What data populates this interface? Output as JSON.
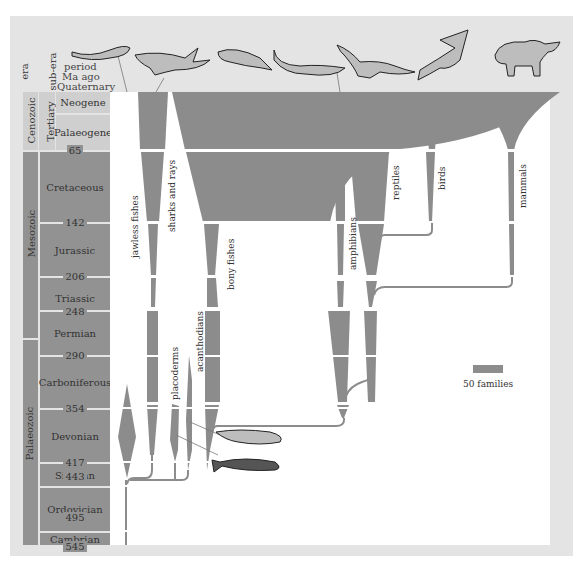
{
  "header": {
    "era": "era",
    "sub_era": "sub-era",
    "period": "period",
    "ma_ago": "Ma ago"
  },
  "eras": [
    {
      "name": "Cenozoic",
      "from": 0,
      "to": 65,
      "subera": "Tertiary"
    },
    {
      "name": "Mesozoic",
      "from": 65,
      "to": 248
    },
    {
      "name": "Palaeozoic",
      "from": 248,
      "to": 545
    }
  ],
  "periods": [
    {
      "name": "Quaternary"
    },
    {
      "name": "Neogene"
    },
    {
      "name": "Palaeogene"
    },
    {
      "name": "Cretaceous"
    },
    {
      "name": "Jurassic"
    },
    {
      "name": "Triassic"
    },
    {
      "name": "Permian"
    },
    {
      "name": "Carboniferous"
    },
    {
      "name": "Devonian"
    },
    {
      "name": "Silurian"
    },
    {
      "name": "Ordovician"
    },
    {
      "name": "Cambrian"
    }
  ],
  "boundaries": [
    "65",
    "142",
    "206",
    "248",
    "290",
    "354",
    "417",
    "443",
    "495",
    "545"
  ],
  "groups": [
    {
      "label": "jawless fishes"
    },
    {
      "label": "sharks and rays"
    },
    {
      "label": "placoderms"
    },
    {
      "label": "acanthodians"
    },
    {
      "label": "bony fishes"
    },
    {
      "label": "amphibians"
    },
    {
      "label": "reptiles"
    },
    {
      "label": "birds"
    },
    {
      "label": "mammals"
    }
  ],
  "legend": {
    "label": "50 families"
  },
  "colors": {
    "band": "#8c8c8c",
    "timescale": "#929292",
    "timescale_light": "#cfcfcf",
    "frame": "#e4e4e4"
  }
}
